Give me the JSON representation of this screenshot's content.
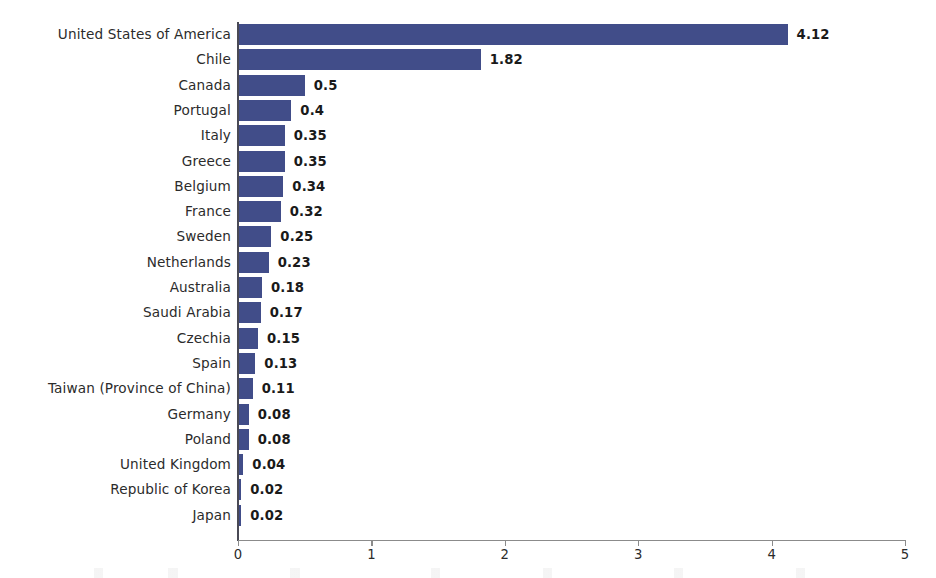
{
  "chart_data": {
    "type": "bar",
    "orientation": "horizontal",
    "title": "",
    "subtitle": "",
    "xlabel": "",
    "ylabel": "",
    "xlim": [
      0,
      5
    ],
    "xticks": [
      "0",
      "1",
      "2",
      "3",
      "4",
      "5"
    ],
    "grid": false,
    "legend": null,
    "bar_color": "#414d89",
    "label_color": "#2b2b2b",
    "value_label_color": "#1a1a1a",
    "axis_color": "#8b8b8b",
    "background": "#ffffff",
    "categories": [
      "United States of America",
      "Chile",
      "Canada",
      "Portugal",
      "Italy",
      "Greece",
      "Belgium",
      "France",
      "Sweden",
      "Netherlands",
      "Australia",
      "Saudi Arabia",
      "Czechia",
      "Spain",
      "Taiwan (Province of China)",
      "Germany",
      "Poland",
      "United Kingdom",
      "Republic of Korea",
      "Japan"
    ],
    "values": [
      4.12,
      1.82,
      0.5,
      0.4,
      0.35,
      0.35,
      0.34,
      0.32,
      0.25,
      0.23,
      0.18,
      0.17,
      0.15,
      0.13,
      0.11,
      0.08,
      0.08,
      0.04,
      0.02,
      0.02
    ],
    "value_labels": [
      "4.12",
      "1.82",
      "0.5",
      "0.4",
      "0.35",
      "0.35",
      "0.34",
      "0.32",
      "0.25",
      "0.23",
      "0.18",
      "0.17",
      "0.15",
      "0.13",
      "0.11",
      "0.08",
      "0.08",
      "0.04",
      "0.02",
      "0.02"
    ]
  }
}
